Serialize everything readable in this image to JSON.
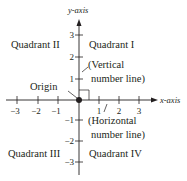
{
  "diagram": {
    "axes": {
      "x_label": "x-axis",
      "y_label": "y-axis",
      "x_ticks": [
        "−3",
        "−2",
        "−1",
        "1",
        "2",
        "3"
      ],
      "y_ticks": [
        "3",
        "2",
        "1",
        "−1",
        "−2",
        "−3"
      ]
    },
    "quadrants": {
      "q1": "Quadrant I",
      "q2": "Quadrant II",
      "q3": "Quadrant III",
      "q4": "Quadrant IV"
    },
    "annotations": {
      "origin": "Origin",
      "vertical_line_1": "(Vertical",
      "vertical_line_2": "number line)",
      "horizontal_line_1": "(Horizontal",
      "horizontal_line_2": "number line)"
    },
    "colors": {
      "ink": "#231f20",
      "background": "#ffffff"
    }
  }
}
